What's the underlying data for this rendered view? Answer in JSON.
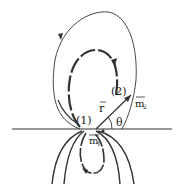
{
  "diagram": {
    "labels": {
      "point1": "(1)",
      "point2": "(2)",
      "r_vector": "r",
      "m1": "m",
      "m1_sub": "1",
      "m2": "m",
      "m2_sub": "2",
      "theta": "θ"
    },
    "colors": {
      "ink": "#333333",
      "background": "#ffffff"
    }
  }
}
